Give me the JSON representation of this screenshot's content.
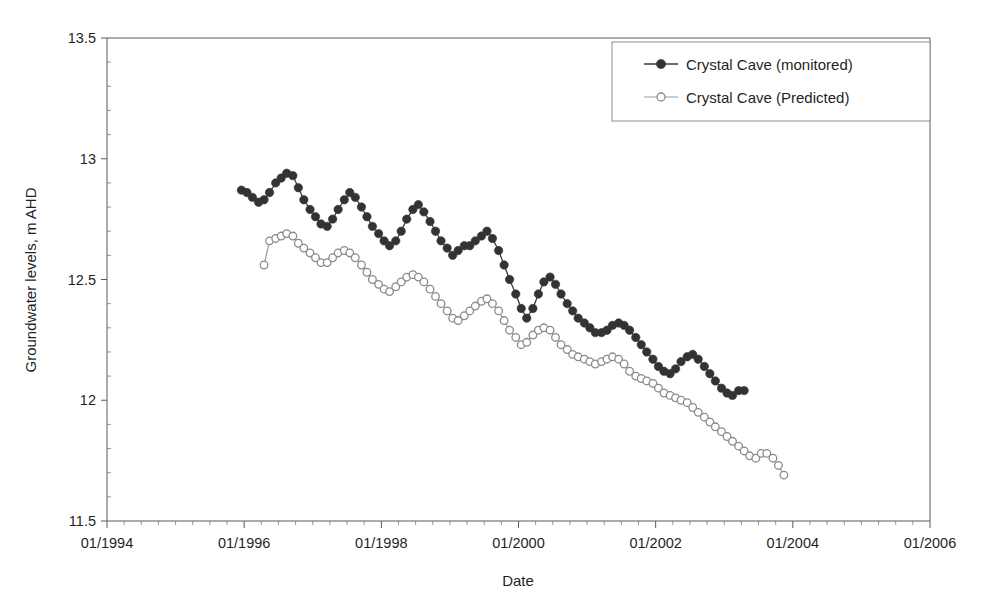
{
  "chart_data": {
    "type": "line",
    "title": "",
    "xlabel": "Date",
    "ylabel": "Groundwater levels, m AHD",
    "xlim": [
      "01/1994",
      "01/2006"
    ],
    "ylim": [
      11.5,
      13.5
    ],
    "ytick_labels": [
      "11.5",
      "12",
      "12.5",
      "13",
      "13.5"
    ],
    "ytick_values": [
      11.5,
      12,
      12.5,
      13,
      13.5
    ],
    "xtick_labels": [
      "01/1994",
      "01/1996",
      "01/1998",
      "01/2000",
      "01/2002",
      "01/2004",
      "01/2006"
    ],
    "xtick_values": [
      1994.0,
      1996.0,
      1998.0,
      2000.0,
      2002.0,
      2004.0,
      2006.0
    ],
    "grid": false,
    "legend_position": "top-right",
    "series": [
      {
        "name": "Crystal Cave (monitored)",
        "marker": "filled-circle",
        "color": "#333333",
        "x": [
          1995.96,
          1996.04,
          1996.12,
          1996.21,
          1996.29,
          1996.37,
          1996.46,
          1996.54,
          1996.62,
          1996.71,
          1996.79,
          1996.87,
          1996.96,
          1997.04,
          1997.12,
          1997.21,
          1997.29,
          1997.37,
          1997.46,
          1997.54,
          1997.62,
          1997.71,
          1997.79,
          1997.87,
          1997.96,
          1998.04,
          1998.12,
          1998.21,
          1998.29,
          1998.37,
          1998.46,
          1998.54,
          1998.62,
          1998.71,
          1998.79,
          1998.87,
          1998.96,
          1999.04,
          1999.12,
          1999.21,
          1999.29,
          1999.37,
          1999.46,
          1999.54,
          1999.62,
          1999.71,
          1999.79,
          1999.87,
          1999.96,
          2000.04,
          2000.12,
          2000.21,
          2000.29,
          2000.37,
          2000.46,
          2000.54,
          2000.62,
          2000.71,
          2000.79,
          2000.87,
          2000.96,
          2001.04,
          2001.12,
          2001.21,
          2001.29,
          2001.37,
          2001.46,
          2001.54,
          2001.62,
          2001.71,
          2001.79,
          2001.87,
          2001.96,
          2002.04,
          2002.12,
          2002.21,
          2002.29,
          2002.37,
          2002.46,
          2002.54,
          2002.62,
          2002.71,
          2002.79,
          2002.87,
          2002.96,
          2003.04,
          2003.12,
          2003.21,
          2003.29
        ],
        "y": [
          12.87,
          12.86,
          12.84,
          12.82,
          12.83,
          12.86,
          12.9,
          12.92,
          12.94,
          12.93,
          12.88,
          12.83,
          12.79,
          12.76,
          12.73,
          12.72,
          12.75,
          12.79,
          12.83,
          12.86,
          12.84,
          12.8,
          12.76,
          12.72,
          12.69,
          12.66,
          12.64,
          12.66,
          12.7,
          12.75,
          12.79,
          12.81,
          12.78,
          12.74,
          12.7,
          12.66,
          12.63,
          12.6,
          12.62,
          12.64,
          12.64,
          12.66,
          12.68,
          12.7,
          12.67,
          12.62,
          12.56,
          12.5,
          12.44,
          12.38,
          12.34,
          12.38,
          12.44,
          12.49,
          12.51,
          12.48,
          12.44,
          12.4,
          12.37,
          12.34,
          12.32,
          12.3,
          12.28,
          12.28,
          12.29,
          12.31,
          12.32,
          12.31,
          12.29,
          12.26,
          12.23,
          12.2,
          12.17,
          12.14,
          12.12,
          12.11,
          12.13,
          12.16,
          12.18,
          12.19,
          12.17,
          12.14,
          12.11,
          12.08,
          12.05,
          12.03,
          12.02,
          12.04,
          12.04
        ]
      },
      {
        "name": "Crystal Cave (Predicted)",
        "marker": "open-circle",
        "color": "#8a8a8a",
        "x": [
          1996.29,
          1996.37,
          1996.46,
          1996.54,
          1996.62,
          1996.71,
          1996.79,
          1996.87,
          1996.96,
          1997.04,
          1997.12,
          1997.21,
          1997.29,
          1997.37,
          1997.46,
          1997.54,
          1997.62,
          1997.71,
          1997.79,
          1997.87,
          1997.96,
          1998.04,
          1998.12,
          1998.21,
          1998.29,
          1998.37,
          1998.46,
          1998.54,
          1998.62,
          1998.71,
          1998.79,
          1998.87,
          1998.96,
          1999.04,
          1999.12,
          1999.21,
          1999.29,
          1999.37,
          1999.46,
          1999.54,
          1999.62,
          1999.71,
          1999.79,
          1999.87,
          1999.96,
          2000.04,
          2000.12,
          2000.21,
          2000.29,
          2000.37,
          2000.46,
          2000.54,
          2000.62,
          2000.71,
          2000.79,
          2000.87,
          2000.96,
          2001.04,
          2001.12,
          2001.21,
          2001.29,
          2001.37,
          2001.46,
          2001.54,
          2001.62,
          2001.71,
          2001.79,
          2001.87,
          2001.96,
          2002.04,
          2002.12,
          2002.21,
          2002.29,
          2002.37,
          2002.46,
          2002.54,
          2002.62,
          2002.71,
          2002.79,
          2002.87,
          2002.96,
          2003.04,
          2003.12,
          2003.21,
          2003.29,
          2003.37,
          2003.46,
          2003.54,
          2003.62,
          2003.71,
          2003.79,
          2003.87
        ],
        "y": [
          12.56,
          12.66,
          12.67,
          12.68,
          12.69,
          12.68,
          12.65,
          12.63,
          12.61,
          12.59,
          12.57,
          12.57,
          12.59,
          12.61,
          12.62,
          12.61,
          12.59,
          12.56,
          12.53,
          12.5,
          12.48,
          12.46,
          12.45,
          12.47,
          12.49,
          12.51,
          12.52,
          12.51,
          12.49,
          12.46,
          12.43,
          12.4,
          12.37,
          12.34,
          12.33,
          12.35,
          12.37,
          12.39,
          12.41,
          12.42,
          12.4,
          12.37,
          12.33,
          12.29,
          12.26,
          12.23,
          12.24,
          12.27,
          12.29,
          12.3,
          12.29,
          12.26,
          12.23,
          12.21,
          12.19,
          12.18,
          12.17,
          12.16,
          12.15,
          12.16,
          12.17,
          12.18,
          12.17,
          12.15,
          12.12,
          12.1,
          12.09,
          12.08,
          12.07,
          12.05,
          12.03,
          12.02,
          12.01,
          12.0,
          11.99,
          11.97,
          11.95,
          11.93,
          11.91,
          11.89,
          11.87,
          11.85,
          11.83,
          11.81,
          11.79,
          11.77,
          11.76,
          11.78,
          11.78,
          11.76,
          11.73,
          11.69
        ]
      }
    ]
  },
  "axes": {
    "y_title": "Groundwater levels, m AHD",
    "x_title": "Date"
  },
  "legend": {
    "entries": [
      {
        "label": "Crystal Cave (monitored)"
      },
      {
        "label": "Crystal Cave (Predicted)"
      }
    ]
  }
}
